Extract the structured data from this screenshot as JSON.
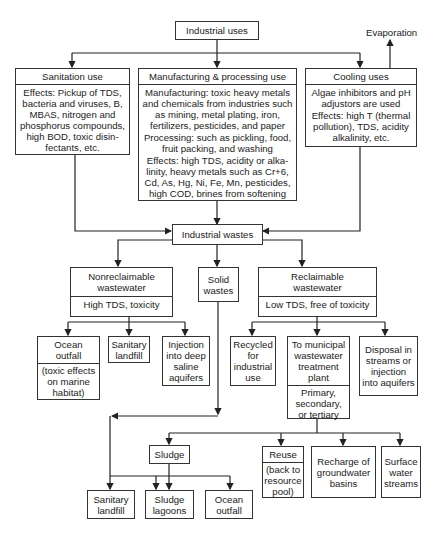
{
  "title": "Industrial uses",
  "evaporation": "Evaporation",
  "uses": {
    "sanitation": {
      "title": "Sanitation use",
      "body": [
        "Effects:  Pickup of TDS, bacteria and viruses, B, MBAS, nitrogen and phosphorus compounds, high BOD, toxic disin-fectants, etc."
      ]
    },
    "manufacturing": {
      "title": "Manufacturing & processing use",
      "body": [
        "Manufacturing:  toxic heavy metals and chemicals from industries such as mining, metal plating, iron, fertilizers, pesticides, and paper",
        "Processing:  such as pickling, food, fruit packing, and washing",
        "Effects:  high TDS, acidity or alka-linity, heavy metals such as Cr+6, Cd, As, Hg, Ni, Fe, Mn, pesticides, high COD, brines from softening"
      ]
    },
    "cooling": {
      "title": "Cooling uses",
      "body": [
        "Algae inhibitors and pH adjustors are used",
        "Effects: high T (thermal pollution), TDS, acidity alkalinity, etc."
      ]
    }
  },
  "wastes": "Industrial wastes",
  "nonreclaimable": {
    "title": "Nonreclaimable wastewater",
    "sub": "High TDS, toxicity"
  },
  "solid": "Solid wastes",
  "reclaimable": {
    "title": "Reclaimable wastewater",
    "sub": "Low TDS, free of toxicity"
  },
  "nonrec_outputs": {
    "ocean": {
      "title": "Ocean outfall",
      "sub": "(toxic effects on marine habitat)"
    },
    "landfill": "Sanitary landfill",
    "injection": "Injection into deep saline aquifers"
  },
  "rec_outputs": {
    "recycled": "Recycled for industrial use",
    "municipal": {
      "title": "To municipal wastewater treatment plant",
      "sub": "Primary, secondary, or tertiary"
    },
    "disposal": "Disposal in streams or injection into aquifers"
  },
  "treatment_outputs": {
    "sludge": "Sludge",
    "reuse": {
      "title": "Reuse",
      "sub": "(back to resource pool)"
    },
    "recharge": "Recharge of groundwater basins",
    "surface": "Surface water streams"
  },
  "sludge_outputs": {
    "landfill": "Sanitary landfill",
    "lagoons": "Sludge lagoons",
    "ocean": "Ocean outfall"
  }
}
